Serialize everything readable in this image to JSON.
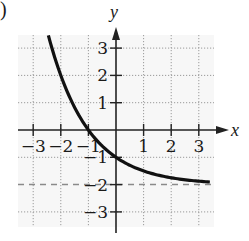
{
  "figure": {
    "label_fragment": ")"
  },
  "chart_data": {
    "type": "line",
    "title": "",
    "xlabel": "x",
    "ylabel": "y",
    "xlim": [
      -3.6,
      3.5
    ],
    "ylim": [
      -3.5,
      3.5
    ],
    "grid": true,
    "grid_style": "dotted",
    "x_ticks": [
      -3,
      -2,
      -1,
      1,
      2,
      3
    ],
    "y_ticks": [
      3,
      2,
      1,
      -1,
      -2,
      -3
    ],
    "x_tick_labels": [
      "−3",
      "−2",
      "−1",
      "1",
      "2",
      "3"
    ],
    "y_tick_labels": [
      "3",
      "2",
      "1",
      "−1",
      "−2",
      "−3"
    ],
    "asymptote": {
      "type": "horizontal",
      "y": -2,
      "style": "dashed",
      "color": "#888888"
    },
    "series": [
      {
        "name": "y = 2^(-x) - 2",
        "color": "#111111",
        "x": [
          -2.45,
          -2.0,
          -1.5,
          -1.0,
          -0.5,
          0.0,
          0.5,
          1.0,
          1.5,
          2.0,
          2.5,
          3.0,
          3.4
        ],
        "y": [
          3.46,
          2.0,
          0.83,
          0.0,
          -0.59,
          -1.0,
          -1.29,
          -1.5,
          -1.65,
          -1.75,
          -1.82,
          -1.875,
          -1.905
        ]
      }
    ],
    "key_points": [
      {
        "x": -1,
        "y": 0
      },
      {
        "x": 0,
        "y": -1
      }
    ]
  }
}
